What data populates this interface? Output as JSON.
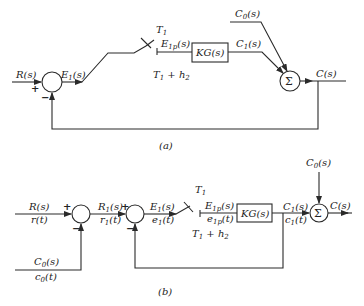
{
  "diagram_a": {
    "caption": "(a)",
    "input_label": "R(s)",
    "error_label": "E",
    "error_sub": "1",
    "error_tail": "(s)",
    "plus_sign": "+",
    "minus_sign": "−",
    "switch_label_T": "T",
    "switch_label_T_sub": "1",
    "sampled_label": "E",
    "sampled_sub": "1p",
    "sampled_tail": "(s)",
    "hold_label": "T",
    "hold_sub1": "1",
    "hold_mid": " + h",
    "hold_sub2": "2",
    "block_label": "KG(s)",
    "c1_label": "C",
    "c1_sub": "1",
    "c1_tail": "(s)",
    "c0_label": "C",
    "c0_sub": "0",
    "c0_tail": "(s)",
    "sum_symbol": "Σ",
    "output_label": "C(s)"
  },
  "diagram_b": {
    "caption": "(b)",
    "input_label_s": "R(s)",
    "input_label_t": "r(t)",
    "c0_in_s": "C",
    "c0_in_s_sub": "0",
    "c0_in_s_tail": "(s)",
    "c0_in_t": "c",
    "c0_in_t_sub": "0",
    "c0_in_t_tail": "(t)",
    "plus_sign": "+",
    "minus_sign": "−",
    "r1_s": "R",
    "r1_s_sub": "1",
    "r1_s_tail": "(s)",
    "r1_t": "r",
    "r1_t_sub": "1",
    "r1_t_tail": "(t)",
    "e1_s": "E",
    "e1_s_sub": "1",
    "e1_s_tail": "(s)",
    "e1_t": "e",
    "e1_t_sub": "1",
    "e1_t_tail": "(t)",
    "switch_label_T": "T",
    "switch_label_T_sub": "1",
    "e1p_s": "E",
    "e1p_s_sub": "1p",
    "e1p_s_tail": "(s)",
    "e1p_t": "e",
    "e1p_t_sub": "1p",
    "e1p_t_tail": "(t)",
    "hold_label": "T",
    "hold_sub1": "1",
    "hold_mid": " + h",
    "hold_sub2": "2",
    "block_label": "KG(s)",
    "c1_s": "C",
    "c1_s_sub": "1",
    "c1_s_tail": "(s)",
    "c1_t": "c",
    "c1_t_sub": "1",
    "c1_t_tail": "(t)",
    "c0_top": "C",
    "c0_top_sub": "0",
    "c0_top_tail": "(s)",
    "sum_symbol": "Σ",
    "output_label": "C(s)"
  }
}
